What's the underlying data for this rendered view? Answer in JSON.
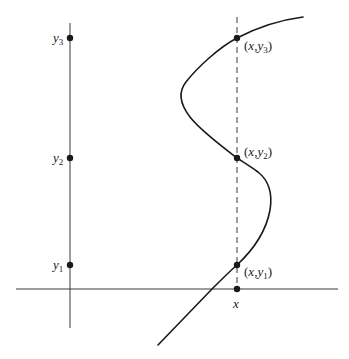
{
  "diagram": {
    "colors": {
      "ink": "#1a1a1a",
      "axis": "#3a3a3a",
      "background": "#ffffff"
    },
    "y_axis_labels": {
      "y3": {
        "base": "y",
        "sub": "3"
      },
      "y2": {
        "base": "y",
        "sub": "2"
      },
      "y1": {
        "base": "y",
        "sub": "1"
      }
    },
    "intersection_labels": {
      "p3": {
        "open": "(",
        "x": "x",
        "comma": ",",
        "base": "y",
        "sub": "3",
        "close": ")"
      },
      "p2": {
        "open": "(",
        "x": "x",
        "comma": ",",
        "base": "y",
        "sub": "2",
        "close": ")"
      },
      "p1": {
        "open": "(",
        "x": "x",
        "comma": ",",
        "base": "y",
        "sub": "1",
        "close": ")"
      }
    },
    "x_axis_label": "x",
    "points": {
      "y_axis_x": 70,
      "x_axis_y": 289,
      "vertical_line_x": 237,
      "y3": 38,
      "y2": 158,
      "y1": 265
    }
  }
}
